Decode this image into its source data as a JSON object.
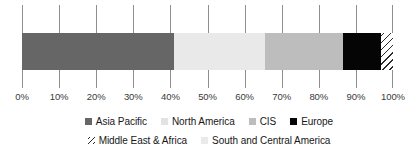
{
  "chart_data": {
    "type": "bar",
    "orientation": "horizontal",
    "stacked": true,
    "normalized_percent": true,
    "title": "",
    "subtitle": "",
    "xlabel": "",
    "ylabel": "",
    "xlim": [
      0,
      100
    ],
    "grid": true,
    "gridlines_axis": "x",
    "legend_position": "bottom",
    "categories": [
      "Share"
    ],
    "x_tick_labels": [
      "0%",
      "10%",
      "20%",
      "30%",
      "40%",
      "50%",
      "60%",
      "70%",
      "80%",
      "90%",
      "100%"
    ],
    "x_tick_values": [
      0,
      10,
      20,
      30,
      40,
      50,
      60,
      70,
      80,
      90,
      100
    ],
    "series": [
      {
        "name": "Asia Pacific",
        "values": [
          41.0
        ],
        "start": 0.0,
        "end": 41.0,
        "color": "#666666",
        "pattern": "solid"
      },
      {
        "name": "North America",
        "values": [
          24.5
        ],
        "start": 41.0,
        "end": 65.5,
        "color": "#e9e9e9",
        "pattern": "solid"
      },
      {
        "name": "CIS",
        "values": [
          21.0
        ],
        "start": 65.5,
        "end": 86.5,
        "color": "#bdbdbd",
        "pattern": "solid"
      },
      {
        "name": "Europe",
        "values": [
          10.3
        ],
        "start": 86.5,
        "end": 96.8,
        "color": "#050505",
        "pattern": "solid"
      },
      {
        "name": "Middle East & Africa",
        "values": [
          3.2
        ],
        "start": 96.8,
        "end": 100.0,
        "color": "#ffffff",
        "pattern": "diagonal-hatch"
      },
      {
        "name": "South and Central America",
        "values": [
          0.0
        ],
        "start": 100.0,
        "end": 100.0,
        "color": "#eaeaea",
        "pattern": "solid"
      }
    ]
  },
  "legend": {
    "rows": [
      {
        "items": [
          {
            "label": "Asia Pacific",
            "swatch": "asia-pacific"
          },
          {
            "label": "North America",
            "swatch": "north-america"
          },
          {
            "label": "CIS",
            "swatch": "cis"
          },
          {
            "label": "Europe",
            "swatch": "europe"
          }
        ]
      },
      {
        "items": [
          {
            "label": "Middle East & Africa",
            "swatch": "mea"
          },
          {
            "label": "South and Central America",
            "swatch": "south-central"
          }
        ]
      }
    ]
  },
  "colors": {
    "asia_pacific": "#666666",
    "north_america": "#e9e9e9",
    "cis": "#bdbdbd",
    "europe": "#050505",
    "middle_east_africa": "#ffffff",
    "south_central_america": "#eaeaea",
    "gridline": "#8e8e8e",
    "axis_text": "#3a3a3a",
    "legend_text": "#171717",
    "background": "#ffffff"
  }
}
